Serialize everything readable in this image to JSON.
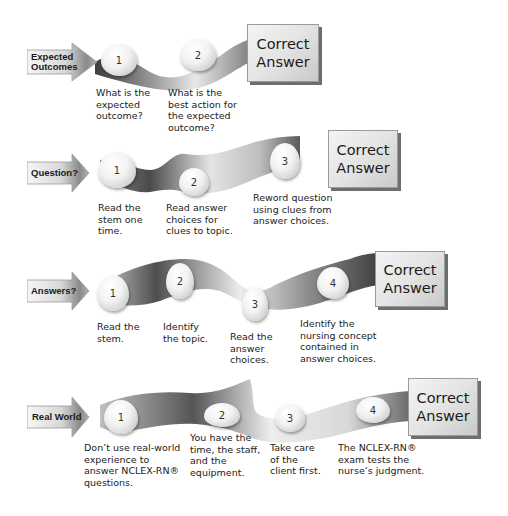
{
  "diagram": {
    "type": "flow-rows",
    "correct_answer_label": [
      "Correct",
      "Answer"
    ],
    "rows": [
      {
        "label": [
          "Expected",
          "Outcomes"
        ],
        "steps": [
          {
            "number": "1",
            "caption": "What is the\nexpected\noutcome?"
          },
          {
            "number": "2",
            "caption": "What is the\nbest action for\nthe expected\noutcome?"
          }
        ]
      },
      {
        "label": [
          "Question?"
        ],
        "steps": [
          {
            "number": "1",
            "caption": "Read the\nstem one\ntime."
          },
          {
            "number": "2",
            "caption": "Read answer\nchoices for\nclues to topic."
          },
          {
            "number": "3",
            "caption": "Reword question\nusing clues from\nanswer choices."
          }
        ]
      },
      {
        "label": [
          "Answers?"
        ],
        "steps": [
          {
            "number": "1",
            "caption": "Read the\nstem."
          },
          {
            "number": "2",
            "caption": "Identify\nthe topic."
          },
          {
            "number": "3",
            "caption": "Read the\nanswer\nchoices."
          },
          {
            "number": "4",
            "caption": "Identify the\nnursing concept\ncontained in\nanswer choices."
          }
        ]
      },
      {
        "label": [
          "Real World"
        ],
        "steps": [
          {
            "number": "1",
            "caption": "Don’t use real-world\nexperience to\nanswer NCLEX-RN®\nquestions."
          },
          {
            "number": "2",
            "caption": "You have the\ntime, the staff,\nand the\nequipment."
          },
          {
            "number": "3",
            "caption": "Take care\nof the\nclient first."
          },
          {
            "number": "4",
            "caption": "The NCLEX-RN®\nexam tests the\nnurse’s judgment."
          }
        ]
      }
    ]
  },
  "colors": {
    "band_dark": "#5a5a5a",
    "band_light": "#e6e6e6",
    "arrow_dark": "#7a7a7a",
    "arrow_light": "#f2f2f2"
  }
}
